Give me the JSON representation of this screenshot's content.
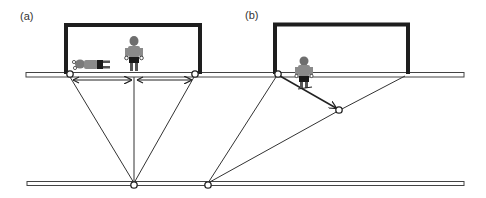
{
  "figure": {
    "panels": [
      {
        "id": "a",
        "label": "(a)"
      },
      {
        "id": "b",
        "label": "(b)"
      }
    ],
    "colors": {
      "goal_frame": "#1e1e1e",
      "line": "#333333",
      "band_fill": "#ffffff",
      "figure_shirt": "#8a8a8a",
      "figure_shorts": "#1a1a1a"
    }
  }
}
